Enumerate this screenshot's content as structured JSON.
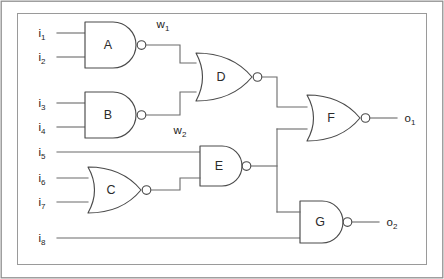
{
  "figure": {
    "kind": "logic-circuit-diagram",
    "title": "",
    "background_color": "#ffffff",
    "wire_color": "#6b6b6b",
    "gate_stroke_color": "#4a4a4a",
    "label_color": "#1d1d1d",
    "frame_color": "#8f8f8f"
  },
  "inputs": [
    {
      "id": "i1",
      "base": "i",
      "sub": "1",
      "y": 33
    },
    {
      "id": "i2",
      "base": "i",
      "sub": "2",
      "y": 57
    },
    {
      "id": "i3",
      "base": "i",
      "sub": "3",
      "y": 103
    },
    {
      "id": "i4",
      "base": "i",
      "sub": "4",
      "y": 127
    },
    {
      "id": "i5",
      "base": "i",
      "sub": "5",
      "y": 152
    },
    {
      "id": "i6",
      "base": "i",
      "sub": "6",
      "y": 178
    },
    {
      "id": "i7",
      "base": "i",
      "sub": "7",
      "y": 202
    },
    {
      "id": "i8",
      "base": "i",
      "sub": "8",
      "y": 238
    }
  ],
  "outputs": [
    {
      "id": "o1",
      "base": "o",
      "sub": "1",
      "y": 118
    },
    {
      "id": "o2",
      "base": "o",
      "sub": "2",
      "y": 222
    }
  ],
  "internal_wires": [
    {
      "id": "w1",
      "base": "w",
      "sub": "1",
      "source_gate": "A",
      "x": 163,
      "y": 24
    },
    {
      "id": "w2",
      "base": "w",
      "sub": "2",
      "source_gate": "B",
      "x": 180,
      "y": 131
    }
  ],
  "gates": [
    {
      "id": "A",
      "label": "A",
      "type": "NAND",
      "inputs": [
        "i1",
        "i2"
      ],
      "output": "w1"
    },
    {
      "id": "B",
      "label": "B",
      "type": "NAND",
      "inputs": [
        "i3",
        "i4"
      ],
      "output": "w2"
    },
    {
      "id": "C",
      "label": "C",
      "type": "NOR",
      "inputs": [
        "i6",
        "i7"
      ],
      "output": "c_out"
    },
    {
      "id": "D",
      "label": "D",
      "type": "NOR",
      "inputs": [
        "w1",
        "w2"
      ],
      "output": "d_out"
    },
    {
      "id": "E",
      "label": "E",
      "type": "NAND",
      "inputs": [
        "i5",
        "c_out"
      ],
      "output": "e_out"
    },
    {
      "id": "F",
      "label": "F",
      "type": "NOR",
      "inputs": [
        "d_out",
        "e_out"
      ],
      "output": "o1"
    },
    {
      "id": "G",
      "label": "G",
      "type": "NAND",
      "inputs": [
        "e_out",
        "i8"
      ],
      "output": "o2"
    }
  ]
}
